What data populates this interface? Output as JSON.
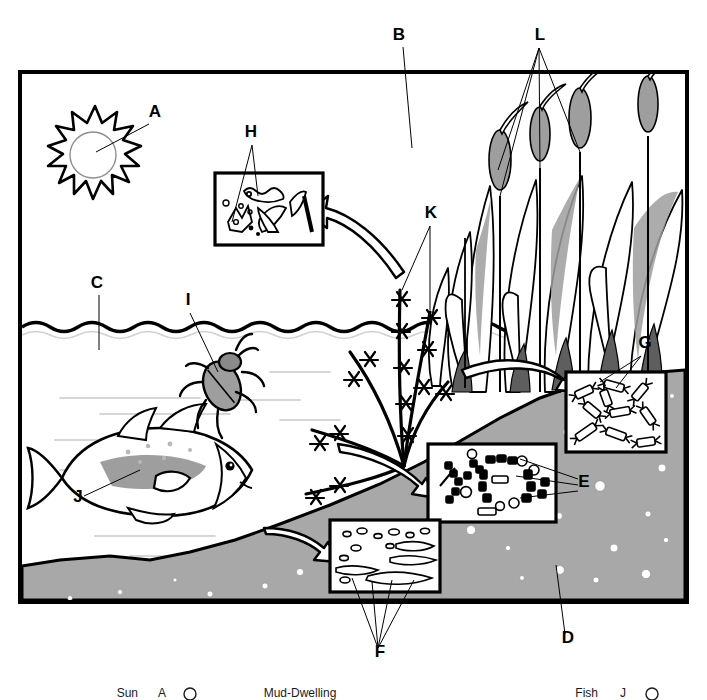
{
  "figure": {
    "type": "labeled-science-illustration",
    "canvas": {
      "width": 707,
      "height": 700
    },
    "frame": {
      "x": 20,
      "y": 72,
      "width": 667,
      "height": 530,
      "stroke": "#000000",
      "stroke_width": 4
    }
  },
  "palette": {
    "ink": "#000000",
    "paper": "#ffffff",
    "sediment_gray": "#a8a8a8",
    "sediment_edge": "#000000",
    "midgray": "#9e9e9e",
    "darkgray": "#6f6f6f",
    "lightgray": "#c9c9c9",
    "pebble_white": "#ffffff"
  },
  "labels": [
    {
      "id": "A",
      "text": "A",
      "x": 155,
      "y": 117,
      "points_to": "sun",
      "leader": [
        [
          149,
          124
        ],
        [
          96,
          152
        ]
      ]
    },
    {
      "id": "B",
      "text": "B",
      "x": 399,
      "y": 40,
      "points_to": "air-atmosphere",
      "leader": [
        [
          403,
          47
        ],
        [
          412,
          148
        ]
      ]
    },
    {
      "id": "C",
      "text": "C",
      "x": 97,
      "y": 288,
      "points_to": "water-surface",
      "leader": [
        [
          99,
          295
        ],
        [
          99,
          350
        ]
      ]
    },
    {
      "id": "D",
      "text": "D",
      "x": 568,
      "y": 643,
      "points_to": "mud-bottom-sediment",
      "leader": [
        [
          565,
          634
        ],
        [
          556,
          565
        ]
      ]
    },
    {
      "id": "E",
      "text": "E",
      "x": 584,
      "y": 487,
      "points_to": "bacteria-inset",
      "leader": [
        [
          578,
          483
        ],
        [
          520,
          462
        ]
      ]
    },
    {
      "id": "F",
      "text": "F",
      "x": 380,
      "y": 657,
      "points_to": "detritus-inset",
      "leader": [
        [
          378,
          648
        ],
        [
          358,
          578
        ]
      ]
    },
    {
      "id": "G",
      "text": "G",
      "x": 645,
      "y": 348,
      "points_to": "invertebrates-inset",
      "leader": [
        [
          641,
          356
        ],
        [
          604,
          382
        ]
      ]
    },
    {
      "id": "H",
      "text": "H",
      "x": 251,
      "y": 137,
      "points_to": "phytoplankton-inset",
      "leader": [
        [
          252,
          145
        ],
        [
          240,
          215
        ]
      ]
    },
    {
      "id": "I",
      "text": "I",
      "x": 188,
      "y": 305,
      "points_to": "water-beetle",
      "leader": [
        [
          190,
          313
        ],
        [
          218,
          372
        ]
      ]
    },
    {
      "id": "J",
      "text": "J",
      "x": 78,
      "y": 502,
      "points_to": "fish",
      "leader": [
        [
          84,
          496
        ],
        [
          140,
          470
        ]
      ]
    },
    {
      "id": "K",
      "text": "K",
      "x": 431,
      "y": 218,
      "points_to": "submerged-aquatic-plants",
      "leader": [
        [
          430,
          226
        ],
        [
          404,
          290
        ]
      ]
    },
    {
      "id": "L",
      "text": "L",
      "x": 540,
      "y": 40,
      "points_to": "cattails-emergent-plants",
      "leader": [
        [
          539,
          48
        ],
        [
          498,
          170
        ]
      ]
    }
  ],
  "insets": [
    {
      "id": "H",
      "name": "phytoplankton-inset",
      "x": 215,
      "y": 173,
      "width": 108,
      "height": 72,
      "contents": "phytoplankton and filamentous algae cells"
    },
    {
      "id": "G",
      "name": "invertebrates-inset",
      "x": 566,
      "y": 372,
      "width": 100,
      "height": 80,
      "contents": "aquatic invertebrates / crustacean larvae"
    },
    {
      "id": "E",
      "name": "bacteria-inset",
      "x": 428,
      "y": 444,
      "width": 128,
      "height": 78,
      "contents": "bacteria: rods, cocci, chains"
    },
    {
      "id": "F",
      "name": "detritus-inset",
      "x": 330,
      "y": 520,
      "width": 110,
      "height": 72,
      "contents": "detritus and decaying organic matter"
    }
  ],
  "scene": {
    "sun": {
      "name": "sun",
      "cx": 95,
      "cy": 152,
      "r_core": 28,
      "points": 16
    },
    "water_surface_y": 325,
    "air_region": "above water surface",
    "water_region": "between surface and sediment",
    "sediment": {
      "name": "mud-bottom",
      "fill": "#a8a8a8",
      "slope": "rises left-to-right"
    },
    "fish": {
      "name": "fish",
      "cx": 148,
      "cy": 478,
      "facing": "right"
    },
    "beetle": {
      "name": "water-beetle",
      "cx": 222,
      "cy": 382
    },
    "cattails": {
      "name": "cattails",
      "count": 5,
      "head_fill": "#9e9e9e"
    },
    "pondweed": {
      "name": "submerged-aquatic-plants",
      "stems": 6
    }
  },
  "arrows": [
    {
      "name": "arrow-to-phytoplankton",
      "from": [
        404,
        268
      ],
      "to": [
        318,
        218
      ],
      "style": "curved-outline",
      "direction": "left-up"
    },
    {
      "name": "arrow-to-invertebrates",
      "from": [
        466,
        376
      ],
      "to": [
        562,
        392
      ],
      "style": "curved-outline",
      "direction": "right"
    },
    {
      "name": "arrow-to-bacteria",
      "from": [
        340,
        452
      ],
      "to": [
        424,
        486
      ],
      "style": "curved-outline",
      "direction": "right-down"
    },
    {
      "name": "arrow-to-detritus",
      "from": [
        268,
        536
      ],
      "to": [
        326,
        556
      ],
      "style": "curved-outline",
      "direction": "right"
    }
  ],
  "legend": {
    "visible_note": "legend row partially cropped at bottom edge",
    "entries": [
      {
        "label": "Sun",
        "key": "A",
        "marker": "circle",
        "x": 138,
        "y": 694
      },
      {
        "label": "Mud-Dwelling",
        "key": "",
        "marker": "",
        "x": 300,
        "y": 694
      },
      {
        "label": "Fish",
        "key": "J",
        "marker": "circle",
        "x": 598,
        "y": 694
      }
    ]
  }
}
